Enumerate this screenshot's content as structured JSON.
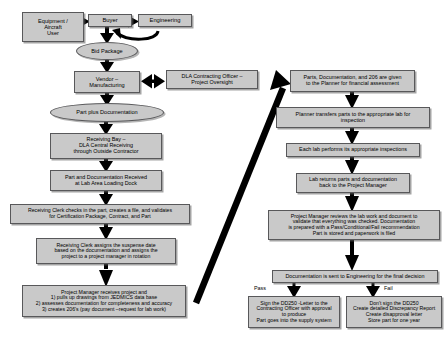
{
  "diagram": {
    "palette": {
      "node_fill": "#c9c9c9",
      "node_border": "#58585a",
      "arrow": "#000000",
      "background": "#ffffff"
    },
    "nodes": [
      {
        "id": "equipment_user",
        "label": "Equipment /\nAircraft\nUser",
        "shape": "rect",
        "x": 22,
        "y": 12,
        "w": 62,
        "h": 30,
        "fontsize": 5.6
      },
      {
        "id": "buyer",
        "label": "Buyer",
        "shape": "rect",
        "x": 88,
        "y": 14,
        "w": 44,
        "h": 13,
        "fontsize": 5.8
      },
      {
        "id": "engineering",
        "label": "Engineering",
        "shape": "rect",
        "x": 138,
        "y": 14,
        "w": 54,
        "h": 13,
        "fontsize": 5.8
      },
      {
        "id": "bid_package",
        "label": "Bid Package",
        "shape": "ellipse",
        "x": 76,
        "y": 42,
        "w": 62,
        "h": 18,
        "fontsize": 5.6
      },
      {
        "id": "vendor",
        "label": "Vendor –\nManufacturing",
        "shape": "rect",
        "x": 74,
        "y": 71,
        "w": 66,
        "h": 22,
        "fontsize": 5.6
      },
      {
        "id": "dla_contracting",
        "label": "DLA Contracting Officer –\nProject Oversight",
        "shape": "rect",
        "x": 166,
        "y": 70,
        "w": 92,
        "h": 19,
        "fontsize": 5.4
      },
      {
        "id": "part_plus_doc",
        "label": "Part plus Documentation",
        "shape": "ellipse",
        "x": 50,
        "y": 103,
        "w": 114,
        "h": 19,
        "fontsize": 5.6
      },
      {
        "id": "receiving_bay",
        "label": "Receiving Bay –\nDLA Central Receiving\nthrough Outside Contractor",
        "shape": "rect",
        "x": 50,
        "y": 133,
        "w": 112,
        "h": 26,
        "fontsize": 5.4
      },
      {
        "id": "part_received",
        "label": "Part and Documentation Received\nat Lab Area Loading Dock",
        "shape": "rect",
        "x": 50,
        "y": 170,
        "w": 112,
        "h": 21,
        "fontsize": 5.4
      },
      {
        "id": "clerk_checks",
        "label": "Receiving Clerk checks in the part, creates a file, and validates\nfor Certification Package, Contract, and Part",
        "shape": "rect",
        "x": 10,
        "y": 204,
        "w": 180,
        "h": 20,
        "fontsize": 5.2
      },
      {
        "id": "clerk_assigns",
        "label": "Receiving Clerk assigns the suspense date\nbased on the documentation and assigns the\nproject to a project manager in rotation",
        "shape": "rect",
        "x": 36,
        "y": 238,
        "w": 140,
        "h": 26,
        "fontsize": 5.2
      },
      {
        "id": "pm_receives",
        "label": "Project Manager receives project and\n1) pulls up drawings from JEDMICS data base\n2) assesses documentation for completeness and accuracy\n3) creates 206's (pay document –request for lab work)",
        "shape": "rect",
        "x": 22,
        "y": 285,
        "w": 164,
        "h": 32,
        "fontsize": 5.2
      },
      {
        "id": "parts_planner",
        "label": "Parts, Documentation, and 206 are given\nto the Planner for financial assessment",
        "shape": "rect",
        "x": 290,
        "y": 70,
        "w": 125,
        "h": 22,
        "fontsize": 5.4
      },
      {
        "id": "planner_transfers",
        "label": "Planner transfers parts to the appropriate lab for\ninspection",
        "shape": "rect",
        "x": 276,
        "y": 107,
        "w": 154,
        "h": 21,
        "fontsize": 5.4
      },
      {
        "id": "each_lab",
        "label": "Each lab performs its appropriate inspections",
        "shape": "rect",
        "x": 286,
        "y": 143,
        "w": 134,
        "h": 14,
        "fontsize": 5.4
      },
      {
        "id": "lab_returns",
        "label": "Lab returns parts and documentation\nback to the Project Manager",
        "shape": "rect",
        "x": 296,
        "y": 173,
        "w": 114,
        "h": 20,
        "fontsize": 5.4
      },
      {
        "id": "pm_reviews",
        "label": "Project Manager reviews the lab work and document to\nvalidate that everything was checked.  Documentation\nis prepared with a Pass/Conditional/Fail recommendation\nPart is stored and paperwork is filed",
        "shape": "rect",
        "x": 268,
        "y": 210,
        "w": 172,
        "h": 30,
        "fontsize": 5.2
      },
      {
        "id": "doc_engineering",
        "label": "Documentation is sent to Engineering for the final decision",
        "shape": "rect",
        "x": 272,
        "y": 270,
        "w": 166,
        "h": 13,
        "fontsize": 5.4
      },
      {
        "id": "pass_action",
        "label": "Sign the DD250 -Letter to the\nContracting  Officer with approval\nto produce\nPart goes into the supply system",
        "shape": "rect",
        "x": 248,
        "y": 296,
        "w": 92,
        "h": 32,
        "fontsize": 5.2
      },
      {
        "id": "fail_action",
        "label": "Don't sign the DD250\nCreate detailed Discrepancy Report\nCreate disapproval letter\nStore part for one year",
        "shape": "rect",
        "x": 346,
        "y": 296,
        "w": 96,
        "h": 32,
        "fontsize": 5.2
      }
    ],
    "edge_labels": [
      {
        "id": "pass_label",
        "text": "Pass",
        "x": 254,
        "y": 286,
        "fontsize": 5.4
      },
      {
        "id": "fail_label",
        "text": "Fail",
        "x": 384,
        "y": 286,
        "fontsize": 5.4
      }
    ]
  }
}
